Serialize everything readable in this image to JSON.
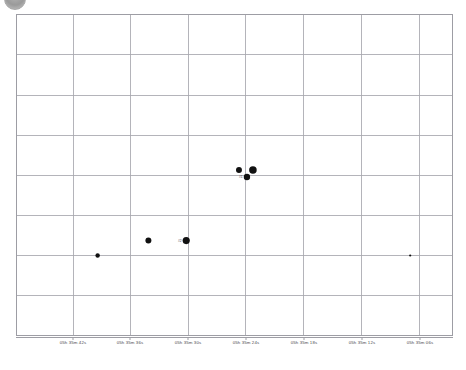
{
  "corner_icon": "circle-avatar-icon",
  "chart_data": {
    "type": "scatter",
    "title": "",
    "subtitle": "",
    "xlabel": "",
    "ylabel": "",
    "grid": true,
    "legend": "none",
    "x_axis": {
      "direction": "right-ascension-decreasing",
      "tick_labels": [
        "05h 35m 42s",
        "05h 35m 36s",
        "05h 35m 30s",
        "05h 35m 24s",
        "05h 35m 18s",
        "05h 35m 12s",
        "05h 35m 06s"
      ],
      "tick_positions_px": [
        73,
        130,
        188,
        246,
        304,
        362,
        420
      ]
    },
    "y_axis": {
      "tick_labels": [],
      "gridline_positions_px": [
        14,
        54,
        95,
        135,
        175,
        216,
        256,
        296,
        336
      ]
    },
    "vertical_gridlines_px": [
      73,
      130,
      188,
      246,
      304,
      362,
      420
    ],
    "points": [
      {
        "label": "",
        "x_px": 97,
        "y_px": 256,
        "r": 2.2
      },
      {
        "label": "",
        "x_px": 148,
        "y_px": 241,
        "r": 3.0
      },
      {
        "label": "#2",
        "x_px": 186,
        "y_px": 241,
        "r": 3.6
      },
      {
        "label": "",
        "x_px": 239,
        "y_px": 170,
        "r": 3.0
      },
      {
        "label": "#1",
        "x_px": 247,
        "y_px": 177,
        "r": 3.2
      },
      {
        "label": "",
        "x_px": 253,
        "y_px": 170,
        "r": 3.8
      },
      {
        "label": "",
        "x_px": 411,
        "y_px": 256,
        "r": 1.1
      }
    ],
    "colors": {
      "point": "#111111",
      "grid": "#a6a6ad",
      "axis": "#9d9da4",
      "background": "#ffffff",
      "tick_text": "#4b4b50"
    }
  }
}
